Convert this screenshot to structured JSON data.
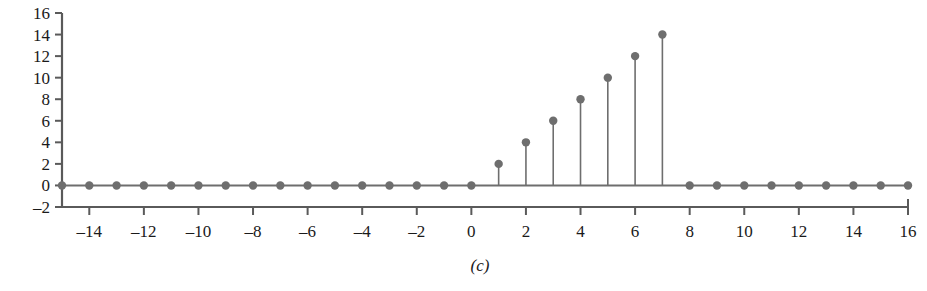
{
  "figure": {
    "caption": "(c)"
  },
  "chart_data": {
    "type": "scatter",
    "style": "stem",
    "title": "",
    "xlabel": "",
    "ylabel": "",
    "xlim": [
      -15,
      16
    ],
    "ylim": [
      -2,
      16
    ],
    "grid": false,
    "legend": null,
    "baseline": 0,
    "marker": "filled-circle",
    "series_color": "#6e6e6e",
    "axis_color": "#5a5a5a",
    "x": [
      -15,
      -14,
      -13,
      -12,
      -11,
      -10,
      -9,
      -8,
      -7,
      -6,
      -5,
      -4,
      -3,
      -2,
      -1,
      0,
      1,
      2,
      3,
      4,
      5,
      6,
      7,
      8,
      9,
      10,
      11,
      12,
      13,
      14,
      15,
      16
    ],
    "values": [
      0,
      0,
      0,
      0,
      0,
      0,
      0,
      0,
      0,
      0,
      0,
      0,
      0,
      0,
      0,
      0,
      2,
      4,
      6,
      8,
      10,
      12,
      14,
      0,
      0,
      0,
      0,
      0,
      0,
      0,
      0,
      0
    ],
    "xticks": [
      -14,
      -12,
      -10,
      -8,
      -6,
      -4,
      -2,
      0,
      2,
      4,
      6,
      8,
      10,
      12,
      14,
      16
    ],
    "xticklabels": [
      "–14",
      "–12",
      "–10",
      "–8",
      "–6",
      "–4",
      "–2",
      "0",
      "2",
      "4",
      "6",
      "8",
      "10",
      "12",
      "14",
      "16"
    ],
    "yticks": [
      -2,
      0,
      2,
      4,
      6,
      8,
      10,
      12,
      14,
      16
    ],
    "yticklabels": [
      "–2",
      "0",
      "2",
      "4",
      "6",
      "8",
      "10",
      "12",
      "14",
      "16"
    ]
  }
}
